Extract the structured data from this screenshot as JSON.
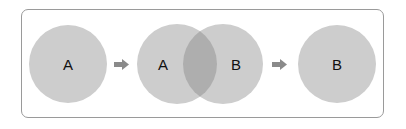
{
  "diagram": {
    "stages": [
      {
        "label": "A"
      },
      {
        "label_left": "A",
        "label_right": "B"
      },
      {
        "label": "B"
      }
    ],
    "colors": {
      "circle": "#cdcdcd",
      "overlap": "#aeaeae",
      "arrow": "#8a8a8a",
      "border": "#9a9a9a",
      "text": "#111111"
    }
  }
}
